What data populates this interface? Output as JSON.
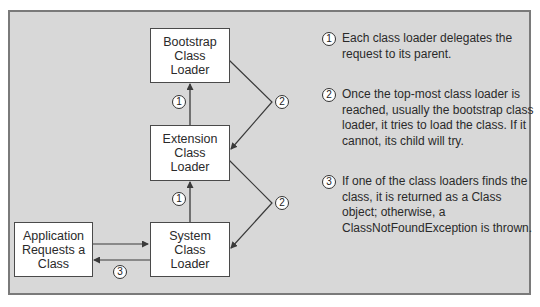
{
  "diagram": {
    "boxes": {
      "bootstrap": {
        "lines": [
          "Bootstrap",
          "Class",
          "Loader"
        ]
      },
      "extension": {
        "lines": [
          "Extension",
          "Class",
          "Loader"
        ]
      },
      "system": {
        "lines": [
          "System",
          "Class",
          "Loader"
        ]
      },
      "application": {
        "lines": [
          "Application",
          "Requests a",
          "Class"
        ]
      }
    },
    "markers": {
      "delegate_1_top": "1",
      "delegate_1_bottom": "1",
      "try_2_top": "2",
      "try_2_bottom": "2",
      "return_3": "3"
    },
    "notes": [
      {
        "number": "1",
        "text": "Each class loader delegates the request to its parent."
      },
      {
        "number": "2",
        "text": "Once the top-most class loader is reached, usually the bootstrap class loader, it tries to load the class. If it cannot, its child will try."
      },
      {
        "number": "3",
        "text": "If one of the class loaders finds the class, it is returned as a Class object; otherwise, a ClassNotFoundException is thrown."
      }
    ],
    "colors": {
      "background": "#d8d8d8",
      "border": "#7a7a7a",
      "box_fill": "#ffffff",
      "line": "#3a3a3a"
    }
  }
}
